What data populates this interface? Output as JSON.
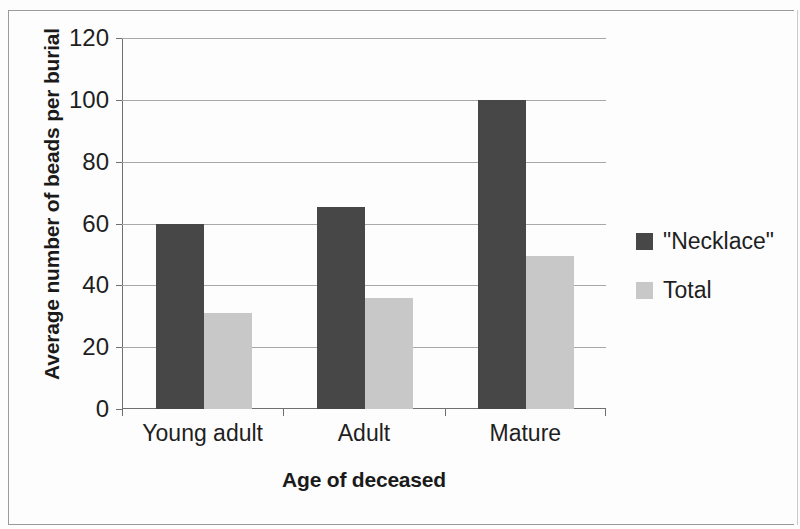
{
  "chart_data": {
    "type": "bar",
    "title": "",
    "subtitle": "",
    "xlabel": "Age of deceased",
    "ylabel": "Average number of beads per burial",
    "categories": [
      "Young adult",
      "Adult",
      "Mature"
    ],
    "series": [
      {
        "name": "\"Necklace\"",
        "color": "#474747",
        "values": [
          60,
          65.5,
          100
        ]
      },
      {
        "name": "Total",
        "color": "#c8c8c8",
        "values": [
          31,
          36,
          49.5
        ]
      }
    ],
    "ylim": [
      0,
      120
    ],
    "ytick_labels": [
      "0",
      "20",
      "40",
      "60",
      "80",
      "100",
      "120"
    ],
    "ytick_values": [
      0,
      20,
      40,
      60,
      80,
      100,
      120
    ],
    "grid": "horizontal",
    "legend_position": "right",
    "annotations": []
  },
  "legend": {
    "items": [
      {
        "label": "\"Necklace\"",
        "swatch": "dark-gray-swatch"
      },
      {
        "label": "Total",
        "swatch": "light-gray-swatch"
      }
    ]
  }
}
